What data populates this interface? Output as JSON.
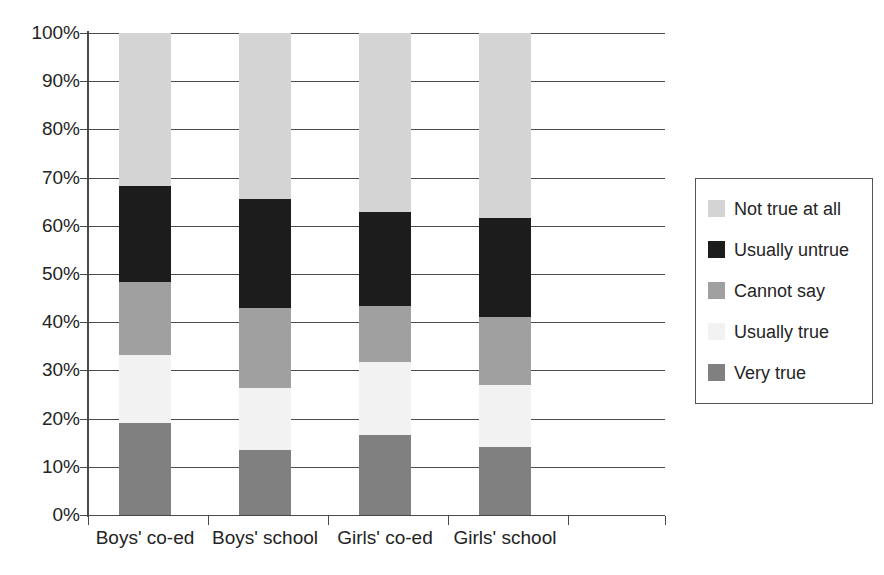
{
  "chart_data": {
    "type": "bar",
    "subtype": "stacked-100-percent",
    "title": "",
    "xlabel": "",
    "ylabel": "",
    "ylim": [
      0,
      100
    ],
    "grid": true,
    "legend_position": "right",
    "categories": [
      "Boys' co-ed",
      "Boys' school",
      "Girls' co-ed",
      "Girls' school"
    ],
    "ytick_labels": [
      "100%",
      "90%",
      "80%",
      "70%",
      "60%",
      "50%",
      "40%",
      "30%",
      "20%",
      "10%",
      "0%"
    ],
    "ytick_values": [
      100,
      90,
      80,
      70,
      60,
      50,
      40,
      30,
      20,
      10,
      0
    ],
    "series": [
      {
        "name": "Very true",
        "color": "#808080",
        "values": [
          19.0,
          13.5,
          16.6,
          14.1
        ]
      },
      {
        "name": "Usually true",
        "color": "#f2f2f2",
        "values": [
          14.3,
          12.8,
          15.1,
          12.9
        ]
      },
      {
        "name": "Cannot say",
        "color": "#a0a0a0",
        "values": [
          15.0,
          16.6,
          11.7,
          14.1
        ]
      },
      {
        "name": "Usually untrue",
        "color": "#1c1c1c",
        "values": [
          20.0,
          22.7,
          19.5,
          20.5
        ]
      },
      {
        "name": "Not true at all",
        "color": "#d4d4d4",
        "values": [
          31.7,
          34.4,
          37.1,
          38.4
        ]
      }
    ],
    "cumulative_tops": {
      "Boys' co-ed": {
        "Very true": 19.0,
        "Usually true": 33.3,
        "Cannot say": 48.3,
        "Usually untrue": 68.3,
        "Not true at all": 100
      },
      "Boys' school": {
        "Very true": 13.5,
        "Usually true": 26.3,
        "Cannot say": 42.9,
        "Usually untrue": 65.6,
        "Not true at all": 100
      },
      "Girls' co-ed": {
        "Very true": 16.6,
        "Usually true": 31.7,
        "Cannot say": 43.4,
        "Usually untrue": 62.9,
        "Not true at all": 100
      },
      "Girls' school": {
        "Very true": 14.1,
        "Usually true": 27.0,
        "Cannot say": 41.1,
        "Usually untrue": 61.6,
        "Not true at all": 100
      }
    }
  },
  "legend": {
    "items": [
      {
        "label": "Not true at all",
        "color": "#d4d4d4"
      },
      {
        "label": "Usually untrue",
        "color": "#1c1c1c"
      },
      {
        "label": "Cannot say",
        "color": "#a0a0a0"
      },
      {
        "label": "Usually true",
        "color": "#f2f2f2"
      },
      {
        "label": "Very true",
        "color": "#808080"
      }
    ]
  },
  "axis": {
    "y_labels": [
      "100%",
      "90%",
      "80%",
      "70%",
      "60%",
      "50%",
      "40%",
      "30%",
      "20%",
      "10%",
      "0%"
    ],
    "x_labels": [
      "Boys' co-ed",
      "Boys' school",
      "Girls' co-ed",
      "Girls' school"
    ]
  },
  "colors": {
    "axis_line": "#4a4a4a",
    "gridline": "#4a4a4a",
    "text": "#242424",
    "legend_border": "#555555",
    "background": "#ffffff"
  }
}
